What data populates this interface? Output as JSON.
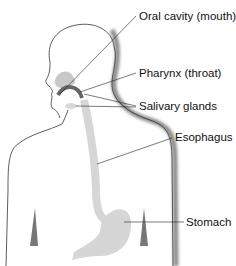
{
  "diagram": {
    "labels": [
      {
        "id": "oral-cavity",
        "text": "Oral cavity (mouth)",
        "x": 139,
        "y": 11
      },
      {
        "id": "pharynx",
        "text": "Pharynx (throat)",
        "x": 139,
        "y": 68
      },
      {
        "id": "salivary-glands",
        "text": "Salivary glands",
        "x": 139,
        "y": 101
      },
      {
        "id": "esophagus",
        "text": "Esophagus",
        "x": 175,
        "y": 132
      },
      {
        "id": "stomach",
        "text": "Stomach",
        "x": 186,
        "y": 217
      }
    ],
    "colors": {
      "outline": "#333333",
      "shadow": "#9a9a9a",
      "organ": "#d6d6d6",
      "organ_dark": "#7a7a7a",
      "leader": "#222222"
    }
  }
}
